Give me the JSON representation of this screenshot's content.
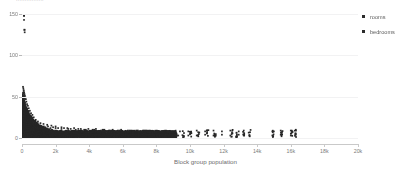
{
  "clipped_header_text": "................",
  "legend": {
    "position": "right",
    "marker_color": "#2b2b2b",
    "items": [
      {
        "label": "rooms",
        "color": "#2b2b2b",
        "marker": "square-marker"
      },
      {
        "label": "bedrooms",
        "color": "#2b2b2b",
        "marker": "square-marker"
      }
    ]
  },
  "axes": {
    "x_title": "Block group population",
    "x_ticks": [
      "0",
      "2k",
      "4k",
      "6k",
      "8k",
      "10k",
      "12k",
      "14k",
      "16k",
      "18k",
      "20k"
    ],
    "x_tick_values": [
      0,
      2000,
      4000,
      6000,
      8000,
      10000,
      12000,
      14000,
      16000,
      18000,
      20000
    ],
    "y_ticks": [
      "0",
      "50",
      "100",
      "150"
    ],
    "y_tick_values": [
      0,
      50,
      100,
      150
    ]
  },
  "chart_data": {
    "type": "scatter",
    "title": "",
    "xlabel": "Block group population",
    "ylabel": "",
    "xlim": [
      0,
      20000
    ],
    "ylim": [
      0,
      155
    ],
    "grid": true,
    "legend_position": "right",
    "series": [
      {
        "name": "rooms",
        "color": "#2b2b2b",
        "points": [
          [
            120,
            148
          ],
          [
            160,
            131
          ],
          [
            60,
            62
          ],
          [
            80,
            60
          ],
          [
            95,
            58
          ],
          [
            110,
            57
          ],
          [
            130,
            55
          ],
          [
            70,
            54
          ],
          [
            150,
            53
          ],
          [
            90,
            52
          ],
          [
            175,
            51
          ],
          [
            120,
            50
          ],
          [
            200,
            49
          ],
          [
            60,
            48
          ],
          [
            230,
            47
          ],
          [
            140,
            46
          ],
          [
            100,
            45
          ],
          [
            260,
            44
          ],
          [
            80,
            43
          ],
          [
            180,
            42
          ],
          [
            300,
            41
          ],
          [
            130,
            40
          ],
          [
            350,
            39
          ],
          [
            220,
            38
          ],
          [
            90,
            37
          ],
          [
            400,
            36
          ],
          [
            160,
            35
          ],
          [
            280,
            34
          ],
          [
            470,
            33
          ],
          [
            110,
            32
          ],
          [
            330,
            31
          ],
          [
            540,
            30
          ],
          [
            200,
            29
          ],
          [
            620,
            28
          ],
          [
            400,
            27
          ],
          [
            150,
            26
          ],
          [
            700,
            25
          ],
          [
            480,
            24
          ],
          [
            260,
            23
          ],
          [
            820,
            22
          ],
          [
            560,
            21
          ],
          [
            340,
            20
          ],
          [
            950,
            20
          ],
          [
            640,
            19
          ],
          [
            430,
            19
          ],
          [
            1100,
            18
          ],
          [
            760,
            18
          ],
          [
            520,
            17
          ],
          [
            1280,
            17
          ],
          [
            900,
            16
          ],
          [
            640,
            16
          ],
          [
            1500,
            16
          ],
          [
            1080,
            15
          ],
          [
            780,
            15
          ],
          [
            1750,
            15
          ],
          [
            1300,
            14
          ],
          [
            950,
            14
          ],
          [
            2000,
            14
          ],
          [
            1550,
            14
          ],
          [
            1150,
            13
          ],
          [
            2350,
            13
          ],
          [
            1850,
            13
          ],
          [
            1400,
            13
          ],
          [
            2700,
            12
          ],
          [
            2150,
            12
          ],
          [
            1700,
            12
          ],
          [
            3100,
            12
          ],
          [
            2500,
            12
          ],
          [
            2000,
            12
          ],
          [
            3500,
            11
          ],
          [
            2900,
            11
          ],
          [
            2350,
            11
          ],
          [
            3950,
            11
          ],
          [
            3350,
            11
          ],
          [
            2750,
            11
          ],
          [
            4400,
            11
          ],
          [
            3800,
            10
          ],
          [
            3200,
            10
          ],
          [
            4900,
            10
          ],
          [
            4300,
            10
          ],
          [
            3700,
            10
          ],
          [
            5400,
            10
          ],
          [
            4800,
            10
          ],
          [
            4200,
            10
          ],
          [
            5900,
            10
          ],
          [
            5300,
            9
          ],
          [
            4700,
            9
          ],
          [
            6400,
            9
          ],
          [
            5800,
            9
          ],
          [
            5200,
            9
          ],
          [
            6900,
            9
          ],
          [
            6300,
            9
          ],
          [
            5700,
            9
          ],
          [
            7400,
            9
          ],
          [
            6800,
            9
          ],
          [
            6200,
            8
          ],
          [
            7900,
            8
          ],
          [
            7300,
            8
          ],
          [
            6700,
            8
          ],
          [
            8400,
            8
          ],
          [
            7800,
            8
          ],
          [
            7200,
            8
          ],
          [
            8900,
            8
          ],
          [
            8300,
            8
          ],
          [
            9400,
            8
          ],
          [
            9900,
            8
          ],
          [
            10400,
            9
          ],
          [
            10900,
            8
          ],
          [
            11400,
            9
          ],
          [
            11900,
            8
          ],
          [
            12400,
            9
          ],
          [
            12900,
            8
          ],
          [
            13200,
            9
          ],
          [
            14900,
            8
          ],
          [
            15400,
            9
          ],
          [
            16000,
            9
          ],
          [
            16300,
            10
          ]
        ]
      },
      {
        "name": "bedrooms",
        "color": "#2b2b2b",
        "points": [
          [
            120,
            143
          ],
          [
            160,
            128
          ],
          [
            60,
            55
          ],
          [
            90,
            51
          ],
          [
            130,
            48
          ],
          [
            70,
            45
          ],
          [
            170,
            43
          ],
          [
            110,
            41
          ],
          [
            220,
            38
          ],
          [
            150,
            36
          ],
          [
            280,
            33
          ],
          [
            95,
            31
          ],
          [
            190,
            29
          ],
          [
            350,
            27
          ],
          [
            250,
            25
          ],
          [
            130,
            23
          ],
          [
            430,
            22
          ],
          [
            320,
            20
          ],
          [
            200,
            19
          ],
          [
            520,
            18
          ],
          [
            400,
            17
          ],
          [
            270,
            16
          ],
          [
            640,
            15
          ],
          [
            500,
            14
          ],
          [
            350,
            13
          ],
          [
            780,
            12
          ],
          [
            620,
            12
          ],
          [
            450,
            11
          ],
          [
            950,
            11
          ],
          [
            760,
            10
          ],
          [
            560,
            10
          ],
          [
            1150,
            9
          ],
          [
            920,
            9
          ],
          [
            700,
            9
          ],
          [
            1400,
            8
          ],
          [
            1120,
            8
          ],
          [
            870,
            8
          ],
          [
            1700,
            7
          ],
          [
            1380,
            7
          ],
          [
            1080,
            7
          ],
          [
            2050,
            7
          ],
          [
            1680,
            6
          ],
          [
            1320,
            6
          ],
          [
            2450,
            6
          ],
          [
            2020,
            6
          ],
          [
            1620,
            6
          ],
          [
            2900,
            6
          ],
          [
            2400,
            6
          ],
          [
            1950,
            5
          ],
          [
            3400,
            5
          ],
          [
            2850,
            5
          ],
          [
            2350,
            5
          ],
          [
            3950,
            5
          ],
          [
            3350,
            5
          ],
          [
            2800,
            5
          ],
          [
            4500,
            5
          ],
          [
            3900,
            5
          ],
          [
            3300,
            5
          ],
          [
            5100,
            4
          ],
          [
            4450,
            4
          ],
          [
            3850,
            4
          ],
          [
            5700,
            4
          ],
          [
            5050,
            4
          ],
          [
            4400,
            4
          ],
          [
            6300,
            4
          ],
          [
            5650,
            4
          ],
          [
            5000,
            4
          ],
          [
            6900,
            4
          ],
          [
            6250,
            4
          ],
          [
            5600,
            4
          ],
          [
            7500,
            4
          ],
          [
            6850,
            4
          ],
          [
            6200,
            4
          ],
          [
            8100,
            4
          ],
          [
            7450,
            4
          ],
          [
            6800,
            3
          ],
          [
            8700,
            3
          ],
          [
            8050,
            3
          ],
          [
            9300,
            3
          ],
          [
            9900,
            3
          ],
          [
            10400,
            3
          ],
          [
            10900,
            4
          ],
          [
            11400,
            3
          ],
          [
            11900,
            4
          ],
          [
            12400,
            3
          ],
          [
            12900,
            4
          ],
          [
            13200,
            3
          ],
          [
            14900,
            3
          ],
          [
            15400,
            4
          ],
          [
            16000,
            3
          ],
          [
            16300,
            4
          ]
        ]
      }
    ]
  }
}
